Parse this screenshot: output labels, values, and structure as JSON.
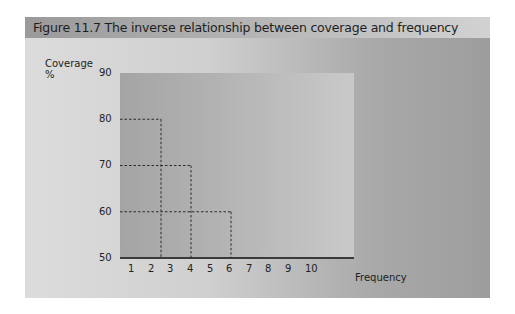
{
  "figure": {
    "title": "Figure 11.7  The inverse relationship between coverage and frequency"
  },
  "axes": {
    "ylabel_line1": "Coverage",
    "ylabel_line2": "%",
    "xlabel": "Frequency",
    "yticks": [
      "90",
      "80",
      "70",
      "60",
      "50"
    ],
    "xticks": [
      "1",
      "2",
      "3",
      "4",
      "5",
      "6",
      "7",
      "8",
      "9",
      "10"
    ]
  },
  "chart_data": {
    "type": "line",
    "title": "The inverse relationship between coverage and frequency",
    "figure_number": "Figure 11.7",
    "xlabel": "Frequency",
    "ylabel": "Coverage %",
    "ylim": [
      50,
      90
    ],
    "xlim": [
      0.5,
      12.6
    ],
    "yticks": [
      50,
      60,
      70,
      80,
      90
    ],
    "xticks": [
      1,
      2,
      3,
      4,
      5,
      6,
      7,
      8,
      9,
      10
    ],
    "grid": false,
    "annotation_style": "dashed drop lines to both axes",
    "series": [
      {
        "name": "Coverage vs frequency trade-off",
        "points": [
          {
            "x": 2.5,
            "y": 80
          },
          {
            "x": 4,
            "y": 70
          },
          {
            "x": 6,
            "y": 60
          }
        ]
      }
    ],
    "colors": {
      "plot_background": "#b0b0b0",
      "dashes": "#2a2a2a",
      "axis": "#3a3a3a"
    }
  }
}
